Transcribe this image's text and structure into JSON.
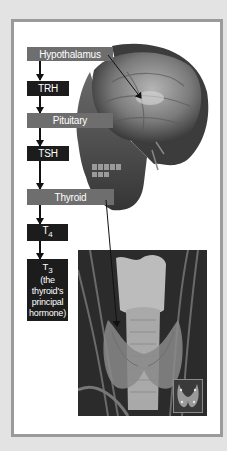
{
  "diagram": {
    "nodes": [
      {
        "id": "hypothalamus",
        "label": "Hypothalamus",
        "type": "organ"
      },
      {
        "id": "trh",
        "label": "TRH",
        "type": "hormone"
      },
      {
        "id": "pituitary",
        "label": "Pituitary",
        "type": "organ"
      },
      {
        "id": "tsh",
        "label": "TSH",
        "type": "hormone"
      },
      {
        "id": "thyroid",
        "label": "Thyroid",
        "type": "organ"
      },
      {
        "id": "t4",
        "label": "T",
        "sub": "4",
        "type": "hormone"
      },
      {
        "id": "t3",
        "label": "T",
        "sub": "3",
        "note": "(the thyroid's principal hormone)",
        "type": "hormone"
      }
    ],
    "edges": [
      [
        "hypothalamus",
        "trh"
      ],
      [
        "trh",
        "pituitary"
      ],
      [
        "pituitary",
        "tsh"
      ],
      [
        "tsh",
        "thyroid"
      ],
      [
        "thyroid",
        "t4"
      ],
      [
        "t4",
        "t3"
      ]
    ],
    "images": {
      "head": "3D rendering of human head/skull showing brain",
      "neck": "Anatomical image of thyroid gland on trachea",
      "inset": "Thyroid gland isolated thumbnail"
    },
    "colors": {
      "organ_box": "#6e6e6e",
      "hormone_box": "#1c1c1c",
      "frame_border": "#9b9b9b",
      "background": "#e3e3e3"
    }
  }
}
